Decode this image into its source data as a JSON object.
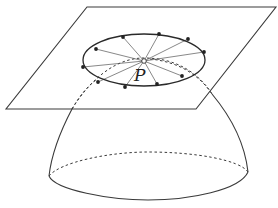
{
  "figure": {
    "point_label": "P",
    "colors": {
      "background": "#ffffff",
      "stroke": "#3a3a3a",
      "spokes": "#555555",
      "dots": "#222222"
    },
    "elements": [
      "tangent-plane",
      "dome-surface",
      "dome-base-ellipse",
      "circle-around-P",
      "radial-spokes",
      "point-P"
    ],
    "circle_point_count": 12
  }
}
